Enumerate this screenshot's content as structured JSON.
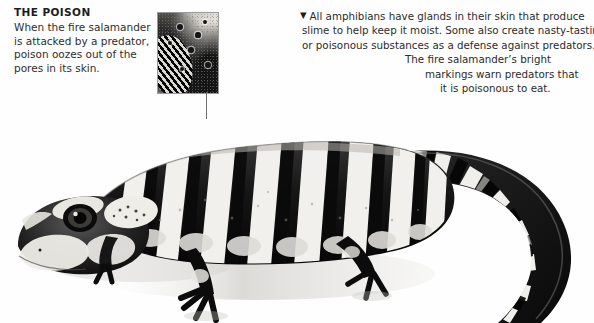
{
  "page": {
    "background_color": "#ffffff"
  },
  "left_caption": {
    "heading": "THE POISON",
    "body": "When the fire salamander is attacked by a predator, poison oozes out of the pores in its skin.",
    "lines": [
      "When the fire salamander",
      "is attacked by a predator,",
      "poison oozes out of the",
      "pores in its skin."
    ],
    "text_color": "#2e2e2e",
    "heading_color": "#1d1d1d"
  },
  "right_caption": {
    "bullet": "▼",
    "body": "All amphibians have glands in their skin that produce slime to help keep it moist. Some also create nasty-tasting or poisonous substances as a defense against predators. The fire salamander's bright markings warn predators that it is poisonous to eat.",
    "lines": [
      "All amphibians have glands in their skin that produce",
      "slime to help keep it moist. Some also create nasty-tasting",
      "or poisonous substances as a defense against predators.",
      "The fire salamander’s bright",
      "markings warn predators that",
      "it is poisonous to eat."
    ],
    "text_color": "#2b2b2b"
  },
  "inset_photo": {
    "name": "skin-pore-closeup",
    "description": "close-up photograph of salamander skin showing poison pores",
    "border_color": "#9a9a9a",
    "pores": [
      {
        "x": 22,
        "y": 14,
        "r": 3.2
      },
      {
        "x": 40,
        "y": 22,
        "r": 2.6
      },
      {
        "x": 47,
        "y": 9,
        "r": 2.4
      },
      {
        "x": 33,
        "y": 37,
        "r": 2.8
      },
      {
        "x": 50,
        "y": 52,
        "r": 3.0
      },
      {
        "x": 24,
        "y": 56,
        "r": 2.2
      },
      {
        "x": 12,
        "y": 30,
        "r": 2.0
      }
    ]
  },
  "connector": {
    "name": "callout-leader-line",
    "color": "#6f6f6f"
  },
  "artwork": {
    "name": "fire-salamander-illustration",
    "style": "black and white halftone drawing",
    "body_dark": "#171717",
    "band_light": "#f2f0ec",
    "shadow_color": "#cfcdc8"
  }
}
